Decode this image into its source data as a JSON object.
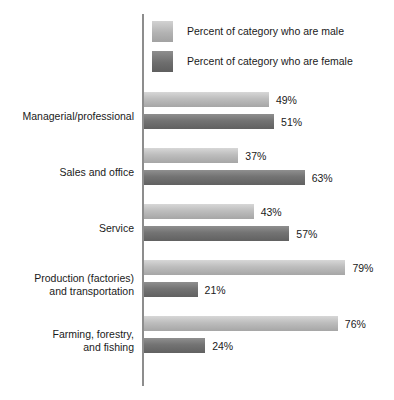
{
  "chart_data": {
    "type": "bar",
    "orientation": "horizontal",
    "title": "",
    "subtitle": "",
    "xlabel": "",
    "ylabel": "",
    "xlim": [
      0,
      100
    ],
    "grid": false,
    "legend_position": "top-right",
    "categories": [
      "Managerial/professional",
      "Sales and office",
      "Service",
      "Production (factories) and transportation",
      "Farming, forestry, and fishing"
    ],
    "series": [
      {
        "name": "Percent of category who are male",
        "values": [
          49,
          37,
          43,
          79,
          76
        ],
        "color": "#bdbdbd"
      },
      {
        "name": "Percent of category who are female",
        "values": [
          51,
          63,
          57,
          21,
          24
        ],
        "color": "#737373"
      }
    ],
    "value_suffix": "%"
  },
  "legend": {
    "items": [
      {
        "label": "Percent of category who are male",
        "swatch": "male"
      },
      {
        "label": "Percent of category who are female",
        "swatch": "female"
      }
    ]
  },
  "groups": [
    {
      "label_lines": [
        "Managerial/professional"
      ],
      "male": {
        "value": 49,
        "label": "49%"
      },
      "female": {
        "value": 51,
        "label": "51%"
      }
    },
    {
      "label_lines": [
        "Sales and office"
      ],
      "male": {
        "value": 37,
        "label": "37%"
      },
      "female": {
        "value": 63,
        "label": "63%"
      }
    },
    {
      "label_lines": [
        "Service"
      ],
      "male": {
        "value": 43,
        "label": "43%"
      },
      "female": {
        "value": 57,
        "label": "57%"
      }
    },
    {
      "label_lines": [
        "Production (factories)",
        "and transportation"
      ],
      "male": {
        "value": 79,
        "label": "79%"
      },
      "female": {
        "value": 21,
        "label": "21%"
      }
    },
    {
      "label_lines": [
        "Farming, forestry,",
        "and fishing"
      ],
      "male": {
        "value": 76,
        "label": "76%"
      },
      "female": {
        "value": 24,
        "label": "24%"
      }
    }
  ],
  "scale": {
    "px_per_percent": 2.55
  }
}
